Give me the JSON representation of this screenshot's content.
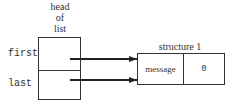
{
  "diagram": {
    "head": {
      "label_lines": [
        "head",
        "of",
        "list"
      ],
      "fields": [
        {
          "name": "first"
        },
        {
          "name": "last"
        }
      ]
    },
    "structure": {
      "title": "structure 1",
      "cells": [
        {
          "text": "message"
        },
        {
          "text": "0"
        }
      ]
    },
    "arrows": [
      {
        "from": "first",
        "to": "structure 1",
        "x1": 70,
        "y1": 59,
        "x2": 137,
        "y2": 59
      },
      {
        "from": "last",
        "to": "structure 1",
        "x1": 70,
        "y1": 80,
        "x2": 137,
        "y2": 80
      }
    ],
    "colors": {
      "stroke": "#222222",
      "background": "#ffffff"
    }
  }
}
